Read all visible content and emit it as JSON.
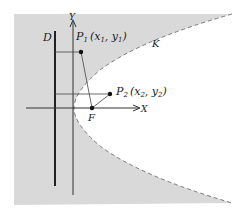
{
  "diagram": {
    "colors": {
      "region_fill": "#d9d9d9",
      "background": "#ffffff",
      "line": "#222222",
      "curve": "#7a7a7a"
    },
    "labels": {
      "directrix": "D",
      "y_axis": "Y",
      "x_axis": "X",
      "focus": "F",
      "curve": "K",
      "point1_name": "P",
      "point1_sub": "1",
      "point1_coords_open": "(x",
      "point1_coords_sub1": "1",
      "point1_coords_mid": ", y",
      "point1_coords_sub2": "1",
      "point1_coords_close": ")",
      "point2_name": "P",
      "point2_sub": "2",
      "point2_coords_open": "(x",
      "point2_coords_sub1": "2",
      "point2_coords_mid": ", y",
      "point2_coords_sub2": "2",
      "point2_coords_close": ")"
    },
    "points": {
      "P1": {
        "x": 81,
        "y": 52
      },
      "P2": {
        "x": 110,
        "y": 94
      },
      "F": {
        "x": 92,
        "y": 108
      }
    }
  }
}
